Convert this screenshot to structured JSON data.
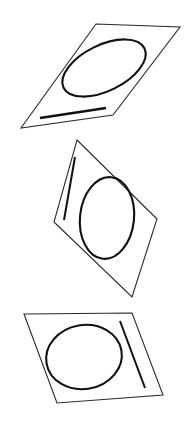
{
  "figure": {
    "canvas": {
      "width": 194,
      "height": 429,
      "background": "#ffffff"
    },
    "stroke_colors": {
      "outline": "#2a2a2a",
      "ellipse": "#111111",
      "bar": "#111111"
    },
    "panels": [
      {
        "id": "panel-top",
        "label": "Top panel",
        "quad_points": "96,24 180,27 113,115 21,128",
        "ellipse": {
          "cx": 104,
          "cy": 68,
          "rx": 45,
          "ry": 23,
          "rotation": -26
        },
        "bar": {
          "x1": 40,
          "y1": 118,
          "x2": 106,
          "y2": 108
        }
      },
      {
        "id": "panel-middle",
        "label": "Middle panel",
        "quad_points": "77,140 157,219 132,297 54,222",
        "ellipse": {
          "cx": 107,
          "cy": 218,
          "rx": 27,
          "ry": 41,
          "rotation": 6
        },
        "bar": {
          "x1": 75,
          "y1": 157,
          "x2": 64,
          "y2": 220
        }
      },
      {
        "id": "panel-bottom",
        "label": "Bottom panel",
        "quad_points": "24,314 132,313 163,395 57,403",
        "ellipse": {
          "cx": 84,
          "cy": 357,
          "rx": 38,
          "ry": 32,
          "rotation": -10
        },
        "bar": {
          "x1": 120,
          "y1": 321,
          "x2": 145,
          "y2": 388
        }
      }
    ]
  }
}
